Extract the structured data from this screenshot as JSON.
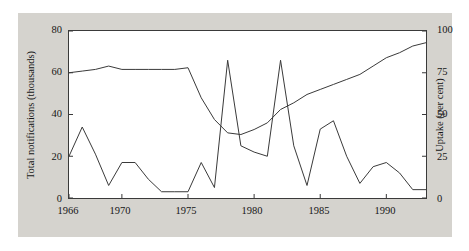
{
  "figure": {
    "background_color": "#d5d3ce",
    "plot_background_color": "#ffffff",
    "line_color": "#3a3a3a"
  },
  "chart_data": {
    "type": "line",
    "title": "",
    "xlabel": "",
    "ylabel": "Total notifications (thousands)",
    "y2label": "Uptake (per cent)",
    "xlim": [
      1966,
      1993
    ],
    "ylim": [
      0,
      80
    ],
    "y2lim": [
      0,
      100
    ],
    "grid": false,
    "legend": "inline-annotations",
    "xticks": [
      1966,
      1970,
      1975,
      1980,
      1985,
      1990
    ],
    "xtick_labels": [
      "1966",
      "1970",
      "1975",
      "1980",
      "1985",
      "1990"
    ],
    "yticks": [
      0,
      20,
      40,
      60,
      80
    ],
    "ytick_labels": [
      "0",
      "20",
      "40",
      "60",
      "80"
    ],
    "y2ticks": [
      0,
      25,
      50,
      75,
      100
    ],
    "y2tick_labels": [
      "0",
      "25",
      "50",
      "75",
      "100"
    ],
    "x": [
      1966,
      1967,
      1968,
      1969,
      1970,
      1971,
      1972,
      1973,
      1974,
      1975,
      1976,
      1977,
      1978,
      1979,
      1980,
      1981,
      1982,
      1983,
      1984,
      1985,
      1986,
      1987,
      1988,
      1989,
      1990,
      1991,
      1992,
      1993
    ],
    "series": [
      {
        "name": "Notifications",
        "axis": "left",
        "units": "thousands",
        "annotation": "Notifications",
        "values": [
          20,
          34,
          21,
          6,
          17,
          17,
          9,
          3,
          3,
          3,
          17,
          5,
          66,
          25,
          22,
          20,
          66,
          25,
          6,
          33,
          37,
          20,
          7,
          15,
          17,
          12,
          4,
          4
        ]
      },
      {
        "name": "Uptake",
        "axis": "right",
        "units": "per cent",
        "annotation": "Uptake",
        "values": [
          75,
          76,
          77,
          79,
          77,
          77,
          77,
          77,
          77,
          78,
          60,
          47,
          39,
          38,
          41,
          45,
          53,
          57,
          62,
          65,
          68,
          71,
          74,
          79,
          84,
          87,
          91,
          93
        ]
      }
    ]
  },
  "annotations": {
    "uptake_label": "Uptake",
    "notifications_label": "Notifications"
  }
}
